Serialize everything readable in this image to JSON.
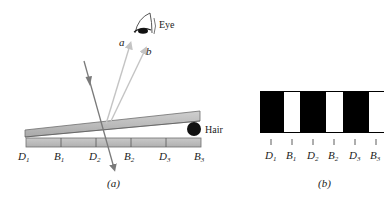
{
  "figure_a": {
    "caption": "(a)",
    "eye_label": "Eye",
    "hair_label": "Hair",
    "ray_labels": [
      "a",
      "b"
    ],
    "positions": [
      {
        "letter": "D",
        "sub": "1"
      },
      {
        "letter": "B",
        "sub": "1"
      },
      {
        "letter": "D",
        "sub": "2"
      },
      {
        "letter": "B",
        "sub": "2"
      },
      {
        "letter": "D",
        "sub": "3"
      },
      {
        "letter": "B",
        "sub": "3"
      }
    ]
  },
  "figure_b": {
    "caption": "(b)",
    "fringe_pattern": [
      "dark",
      "bright",
      "dark",
      "bright",
      "dark",
      "bright"
    ],
    "positions": [
      {
        "letter": "D",
        "sub": "1"
      },
      {
        "letter": "B",
        "sub": "1"
      },
      {
        "letter": "D",
        "sub": "2"
      },
      {
        "letter": "B",
        "sub": "2"
      },
      {
        "letter": "D",
        "sub": "3"
      },
      {
        "letter": "B",
        "sub": "3"
      }
    ]
  },
  "colors": {
    "incident_ray": "#7a7a7a",
    "reflected_rays": "#c4c4c4",
    "glass": "#b5b5b5",
    "dark_fringe": "#000000",
    "bright_fringe": "#ffffff"
  }
}
